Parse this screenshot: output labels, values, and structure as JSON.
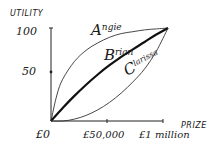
{
  "chart_data": {
    "type": "line",
    "title": "",
    "xlabel": "PRIZE",
    "ylabel": "UTILITY",
    "x_tick_labels": [
      "£0",
      "£50,000",
      "£1 million"
    ],
    "x_ticks": [
      0,
      0.5,
      1
    ],
    "y_tick_labels": [
      "100",
      "50"
    ],
    "y_ticks": [
      100,
      50
    ],
    "xlim": [
      0,
      1
    ],
    "ylim": [
      0,
      100
    ],
    "grid": false,
    "legend": "none (curves labelled directly)",
    "series": [
      {
        "name": "Angie",
        "label_first": "A",
        "label_rest": "ngie",
        "shape": "concave",
        "x": [
          0,
          0.05,
          0.1,
          0.2,
          0.3,
          0.4,
          0.5,
          0.6,
          0.7,
          0.8,
          0.9,
          1.0
        ],
        "values": [
          0,
          28,
          45,
          64,
          76,
          84,
          90,
          94,
          96,
          98,
          99,
          100
        ]
      },
      {
        "name": "Brian",
        "label_first": "B",
        "label_rest": "rian",
        "shape": "near-linear (slightly concave)",
        "x": [
          0,
          0.1,
          0.2,
          0.3,
          0.4,
          0.5,
          0.6,
          0.7,
          0.8,
          0.9,
          1.0
        ],
        "values": [
          0,
          14,
          27,
          39,
          50,
          60,
          69,
          77,
          85,
          93,
          100
        ]
      },
      {
        "name": "Clarissa",
        "label_first": "C",
        "label_rest": "larissa",
        "shape": "convex",
        "x": [
          0,
          0.1,
          0.2,
          0.3,
          0.4,
          0.5,
          0.6,
          0.7,
          0.8,
          0.9,
          1.0
        ],
        "values": [
          0,
          0,
          2,
          6,
          12,
          20,
          30,
          42,
          56,
          75,
          100
        ]
      }
    ]
  }
}
